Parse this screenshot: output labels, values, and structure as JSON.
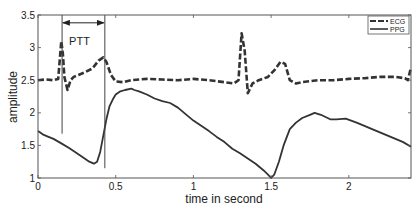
{
  "chart_data": {
    "type": "line",
    "title": "",
    "xlabel": "time in second",
    "ylabel": "amplitude",
    "xlim": [
      0,
      2.4
    ],
    "ylim": [
      1,
      3.5
    ],
    "xticks": [
      0,
      0.5,
      1,
      1.5,
      2
    ],
    "xtick_labels": [
      "0",
      "0.5",
      "1",
      "1.5",
      "2"
    ],
    "yticks": [
      1,
      1.5,
      2,
      2.5,
      3,
      3.5
    ],
    "ytick_labels": [
      "1",
      "1.5",
      "2",
      "2.5",
      "3",
      "3.5"
    ],
    "grid": false,
    "legend_position": "upper right",
    "series": [
      {
        "name": "ECG",
        "style": "dashed",
        "color": "#333333",
        "x": [
          0,
          0.05,
          0.1,
          0.13,
          0.15,
          0.16,
          0.17,
          0.19,
          0.21,
          0.23,
          0.26,
          0.3,
          0.35,
          0.39,
          0.42,
          0.44,
          0.47,
          0.5,
          0.55,
          0.6,
          0.7,
          0.8,
          0.9,
          1.0,
          1.1,
          1.2,
          1.26,
          1.29,
          1.31,
          1.33,
          1.35,
          1.38,
          1.42,
          1.48,
          1.52,
          1.56,
          1.59,
          1.62,
          1.66,
          1.7,
          1.8,
          1.9,
          2.0,
          2.1,
          2.2,
          2.3,
          2.36,
          2.38,
          2.4
        ],
        "y": [
          2.5,
          2.51,
          2.5,
          2.52,
          3.1,
          2.9,
          2.55,
          2.35,
          2.5,
          2.55,
          2.58,
          2.62,
          2.68,
          2.8,
          2.85,
          2.78,
          2.58,
          2.48,
          2.47,
          2.5,
          2.52,
          2.51,
          2.5,
          2.52,
          2.5,
          2.47,
          2.45,
          2.5,
          3.22,
          2.95,
          2.3,
          2.45,
          2.5,
          2.55,
          2.65,
          2.78,
          2.75,
          2.5,
          2.45,
          2.47,
          2.5,
          2.5,
          2.52,
          2.53,
          2.55,
          2.55,
          2.53,
          2.5,
          2.7
        ]
      },
      {
        "name": "PPG",
        "style": "solid",
        "color": "#333333",
        "x": [
          0,
          0.03,
          0.06,
          0.1,
          0.15,
          0.2,
          0.25,
          0.3,
          0.33,
          0.36,
          0.38,
          0.4,
          0.42,
          0.44,
          0.46,
          0.48,
          0.5,
          0.53,
          0.56,
          0.6,
          0.62,
          0.65,
          0.7,
          0.75,
          0.8,
          0.85,
          0.9,
          0.95,
          1.0,
          1.05,
          1.1,
          1.15,
          1.2,
          1.25,
          1.3,
          1.35,
          1.4,
          1.45,
          1.48,
          1.5,
          1.52,
          1.55,
          1.58,
          1.62,
          1.66,
          1.7,
          1.75,
          1.78,
          1.82,
          1.88,
          1.92,
          1.98,
          2.05,
          2.1,
          2.15,
          2.2,
          2.25,
          2.3,
          2.35,
          2.4
        ],
        "y": [
          1.72,
          1.67,
          1.64,
          1.6,
          1.53,
          1.46,
          1.38,
          1.3,
          1.25,
          1.22,
          1.25,
          1.4,
          1.65,
          1.9,
          2.1,
          2.2,
          2.28,
          2.33,
          2.35,
          2.37,
          2.35,
          2.33,
          2.28,
          2.22,
          2.18,
          2.15,
          2.08,
          1.98,
          1.88,
          1.8,
          1.72,
          1.63,
          1.55,
          1.45,
          1.38,
          1.3,
          1.22,
          1.12,
          1.05,
          1.0,
          1.05,
          1.25,
          1.5,
          1.75,
          1.85,
          1.92,
          1.97,
          2.0,
          1.97,
          1.9,
          1.9,
          1.91,
          1.85,
          1.8,
          1.75,
          1.7,
          1.65,
          1.6,
          1.55,
          1.48
        ]
      }
    ],
    "annotations": [
      {
        "type": "vline",
        "x": 0.155,
        "y_from": 1.68,
        "y_to": 3.5
      },
      {
        "type": "vline",
        "x": 0.43,
        "y_from": 1.15,
        "y_to": 3.5
      },
      {
        "type": "double-arrow",
        "x_from": 0.16,
        "x_to": 0.43,
        "y": 3.38
      },
      {
        "type": "text",
        "text": "PTT",
        "x": 0.2,
        "y": 3.1
      }
    ]
  },
  "labels": {
    "xlabel": "time in second",
    "ylabel": "amplitude",
    "ptt": "PTT",
    "legend": [
      "ECG",
      "PPG"
    ]
  }
}
